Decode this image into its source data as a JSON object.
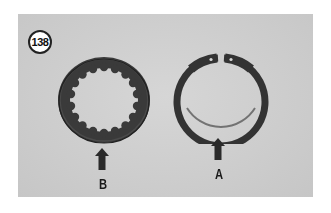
{
  "figure": {
    "number": "138",
    "background_color": "#cfcfcf",
    "ink_color": "#2f2f2f",
    "parts": [
      {
        "id": "B",
        "label": "B",
        "description": "splined-plate",
        "icon": "splined-ring-icon"
      },
      {
        "id": "A",
        "label": "A",
        "description": "snap-ring",
        "icon": "circlip-icon"
      }
    ],
    "arrows": [
      {
        "points_to": "B",
        "icon": "arrow-up-icon"
      },
      {
        "points_to": "A",
        "icon": "arrow-up-icon"
      }
    ]
  }
}
